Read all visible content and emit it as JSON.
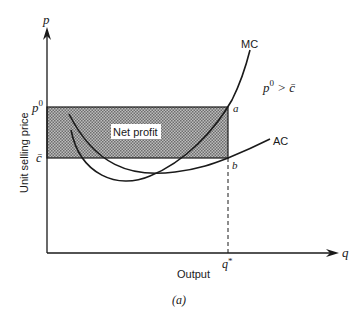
{
  "diagram": {
    "caption": "(a)",
    "y_axis": {
      "symbol": "p",
      "label": "Unit selling price"
    },
    "x_axis": {
      "symbol": "q",
      "label": "Output"
    },
    "price_level": {
      "label": "p",
      "superscript": "0"
    },
    "cost_level": {
      "label": "c̄"
    },
    "quantity": {
      "label": "q",
      "superscript": "*"
    },
    "region": {
      "label": "Net profit"
    },
    "curves": [
      {
        "name": "MC",
        "label": "MC"
      },
      {
        "name": "AC",
        "label": "AC"
      }
    ],
    "points": {
      "a": "a",
      "b": "b"
    },
    "condition": {
      "left": "p",
      "left_sup": "0",
      "op": ">",
      "right": "c̄"
    },
    "colors": {
      "ink": "#1a1a1a",
      "hatch_dark": "#6e6e6e",
      "hatch_light": "#bdbdbd",
      "label_bg": "#ffffff"
    }
  }
}
